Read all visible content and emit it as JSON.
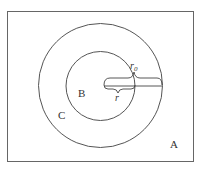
{
  "diagram": {
    "regions": {
      "outer": "A",
      "ring": "C",
      "inner": "B"
    },
    "labels": {
      "outer_radius": "r",
      "outer_radius_sub": "0",
      "inner_radius": "r"
    },
    "colors": {
      "stroke": "#555555",
      "text": "#333333",
      "background": "#ffffff"
    }
  }
}
